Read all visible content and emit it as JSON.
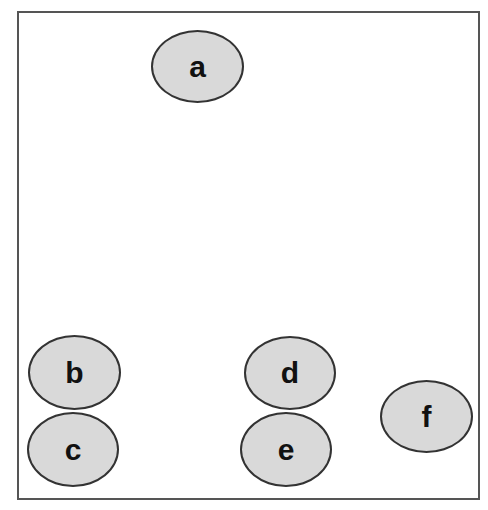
{
  "diagram": {
    "nodes": [
      {
        "id": "a",
        "label": "a",
        "x": 151,
        "y": 30,
        "w": 93,
        "h": 73
      },
      {
        "id": "b",
        "label": "b",
        "x": 28,
        "y": 335,
        "w": 93,
        "h": 75
      },
      {
        "id": "c",
        "label": "c",
        "x": 27,
        "y": 412,
        "w": 92,
        "h": 75
      },
      {
        "id": "d",
        "label": "d",
        "x": 244,
        "y": 336,
        "w": 92,
        "h": 74
      },
      {
        "id": "e",
        "label": "e",
        "x": 240,
        "y": 412,
        "w": 92,
        "h": 75
      },
      {
        "id": "f",
        "label": "f",
        "x": 380,
        "y": 380,
        "w": 93,
        "h": 73
      }
    ],
    "colors": {
      "node_fill": "#d9d9d9",
      "node_border": "#333333",
      "frame_border": "#555555"
    }
  }
}
